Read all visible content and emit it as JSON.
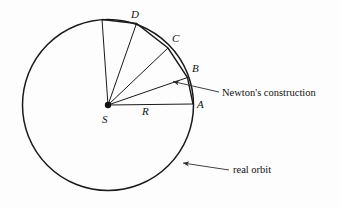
{
  "figure": {
    "background_color": "#fdfdfd",
    "stroke_color": "#1a1a1a",
    "annotation_color": "#2b2b2b"
  },
  "geometry": {
    "circle": {
      "cx": 108,
      "cy": 105,
      "r": 85.5
    },
    "center_dot": {
      "cx": 108,
      "cy": 105,
      "r": 3.2
    },
    "vertices": [
      {
        "name": "A",
        "x": 193.0,
        "y": 104.0
      },
      {
        "name": "B",
        "x": 187.5,
        "y": 77.5
      },
      {
        "name": "C",
        "x": 168.0,
        "y": 48.0
      },
      {
        "name": "D",
        "x": 136.5,
        "y": 23.5
      },
      {
        "name": "E",
        "x": 102.0,
        "y": 19.5
      }
    ]
  },
  "labels": {
    "points": [
      {
        "text": "D",
        "x": 131,
        "y": 9
      },
      {
        "text": "C",
        "x": 172,
        "y": 33
      },
      {
        "text": "B",
        "x": 192,
        "y": 63
      },
      {
        "text": "A",
        "x": 197,
        "y": 99
      },
      {
        "text": "S",
        "x": 102,
        "y": 114
      },
      {
        "text": "R",
        "x": 142,
        "y": 106
      }
    ],
    "annotations": [
      {
        "name": "newtons-construction",
        "text": "Newton's construction",
        "x": 222,
        "y": 88,
        "leader": {
          "x1": 219,
          "y1": 92,
          "x2": 173,
          "y2": 81.5
        }
      },
      {
        "name": "real-orbit",
        "text": "real orbit",
        "x": 233,
        "y": 165,
        "leader": {
          "x1": 229,
          "y1": 170,
          "x2": 183,
          "y2": 163
        }
      }
    ]
  }
}
